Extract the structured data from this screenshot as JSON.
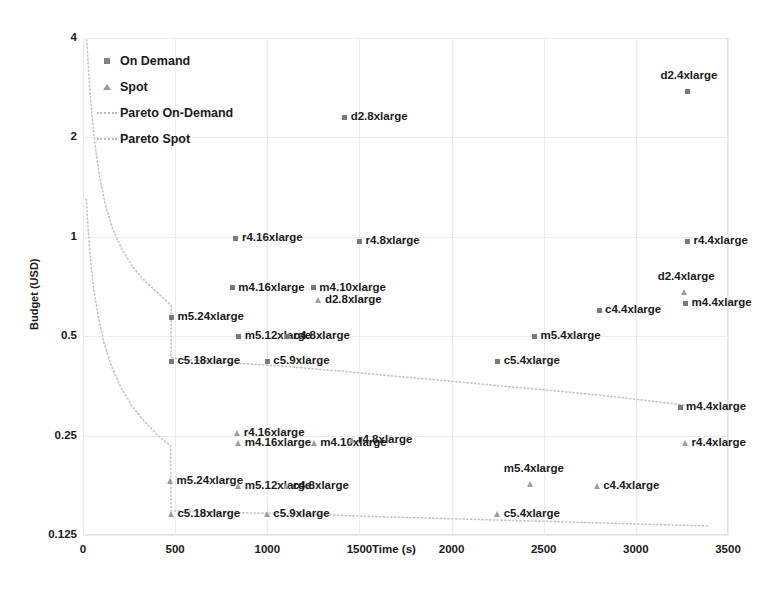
{
  "chart_data": {
    "type": "scatter",
    "title": "",
    "xlabel": "Time (s)",
    "ylabel": "Budget (USD)",
    "xlim": [
      0,
      3500
    ],
    "ylim": [
      0.125,
      4
    ],
    "yscale": "log2",
    "grid": true,
    "legend_position": "top-left",
    "xticks": [
      "0",
      "500",
      "1000",
      "1500",
      "2000",
      "2500",
      "3000",
      "3500"
    ],
    "xtick_values": [
      0,
      500,
      1000,
      1500,
      2000,
      2500,
      3000,
      3500
    ],
    "yticks": [
      "0.125",
      "0.25",
      "0.5",
      "1",
      "2",
      "4"
    ],
    "ytick_values": [
      0.125,
      0.25,
      0.5,
      1,
      2,
      4
    ],
    "legend": [
      {
        "label": "On Demand",
        "marker": "square",
        "color": "#808080"
      },
      {
        "label": "Spot",
        "marker": "triangle",
        "color": "#9a9a9a"
      },
      {
        "label": "Pareto On-Demand",
        "marker": "dotted-line",
        "color": "#bdbdbd"
      },
      {
        "label": "Pareto Spot",
        "marker": "dotted-line",
        "color": "#bdbdbd"
      }
    ],
    "series": [
      {
        "name": "On Demand",
        "marker": "square",
        "points": [
          {
            "label": "d2.4xlarge",
            "x": 3280,
            "y": 2.76,
            "pos": "above"
          },
          {
            "label": "d2.8xlarge",
            "x": 1420,
            "y": 2.3,
            "pos": "right"
          },
          {
            "label": "r4.16xlarge",
            "x": 830,
            "y": 0.99,
            "pos": "right"
          },
          {
            "label": "r4.8xlarge",
            "x": 1500,
            "y": 0.97,
            "pos": "right"
          },
          {
            "label": "r4.4xlarge",
            "x": 3280,
            "y": 0.97,
            "pos": "right"
          },
          {
            "label": "m4.16xlarge",
            "x": 810,
            "y": 0.7,
            "pos": "right"
          },
          {
            "label": "m4.10xlarge",
            "x": 1250,
            "y": 0.7,
            "pos": "right"
          },
          {
            "label": "m4.4xlarge",
            "x": 3270,
            "y": 0.63,
            "pos": "right"
          },
          {
            "label": "c4.4xlarge",
            "x": 2800,
            "y": 0.6,
            "pos": "right"
          },
          {
            "label": "m5.24xlarge",
            "x": 480,
            "y": 0.57,
            "pos": "right"
          },
          {
            "label": "m5.12xlarge",
            "x": 845,
            "y": 0.5,
            "pos": "right"
          },
          {
            "label": "c4.8xlarge",
            "x": 1110,
            "y": 0.5,
            "pos": "right"
          },
          {
            "label": "m5.4xlarge",
            "x": 2450,
            "y": 0.5,
            "pos": "right"
          },
          {
            "label": "c5.18xlarge",
            "x": 480,
            "y": 0.42,
            "pos": "right"
          },
          {
            "label": "c5.9xlarge",
            "x": 1000,
            "y": 0.42,
            "pos": "right"
          },
          {
            "label": "c5.4xlarge",
            "x": 2250,
            "y": 0.42,
            "pos": "right"
          },
          {
            "label": "m4.4xlarge",
            "x": 3240,
            "y": 0.305,
            "pos": "right"
          }
        ]
      },
      {
        "name": "Spot",
        "marker": "triangle",
        "points": [
          {
            "label": "d2.8xlarge",
            "x": 1280,
            "y": 0.645,
            "pos": "right"
          },
          {
            "label": "d2.4xlarge",
            "x": 3265,
            "y": 0.68,
            "pos": "above"
          },
          {
            "label": "r4.16xlarge",
            "x": 840,
            "y": 0.255,
            "pos": "right"
          },
          {
            "label": "m4.16xlarge",
            "x": 845,
            "y": 0.238,
            "pos": "right"
          },
          {
            "label": "m4.10xlarge",
            "x": 1255,
            "y": 0.238,
            "pos": "right"
          },
          {
            "label": "r4.8xlarge",
            "x": 1460,
            "y": 0.242,
            "pos": "right"
          },
          {
            "label": "r4.4xlarge",
            "x": 3270,
            "y": 0.238,
            "pos": "right"
          },
          {
            "label": "m5.24xlarge",
            "x": 475,
            "y": 0.182,
            "pos": "right"
          },
          {
            "label": "m5.12xlarge",
            "x": 845,
            "y": 0.176,
            "pos": "right"
          },
          {
            "label": "c4.8xlarge",
            "x": 1105,
            "y": 0.176,
            "pos": "right"
          },
          {
            "label": "m5.4xlarge",
            "x": 2430,
            "y": 0.178,
            "pos": "above"
          },
          {
            "label": "c4.4xlarge",
            "x": 2790,
            "y": 0.176,
            "pos": "right"
          },
          {
            "label": "c5.18xlarge",
            "x": 480,
            "y": 0.145,
            "pos": "right"
          },
          {
            "label": "c5.9xlarge",
            "x": 1000,
            "y": 0.145,
            "pos": "right"
          },
          {
            "label": "c5.4xlarge",
            "x": 2250,
            "y": 0.145,
            "pos": "right"
          }
        ]
      }
    ],
    "curves": [
      {
        "name": "Pareto On-Demand",
        "style": "dotted",
        "points": [
          [
            20,
            3.95
          ],
          [
            30,
            3.2
          ],
          [
            45,
            2.45
          ],
          [
            65,
            1.9
          ],
          [
            90,
            1.52
          ],
          [
            120,
            1.26
          ],
          [
            160,
            1.06
          ],
          [
            210,
            0.92
          ],
          [
            270,
            0.81
          ],
          [
            340,
            0.73
          ],
          [
            420,
            0.665
          ],
          [
            478,
            0.62
          ],
          [
            478,
            0.43
          ],
          [
            560,
            0.425
          ],
          [
            700,
            0.42
          ],
          [
            900,
            0.412
          ],
          [
            1100,
            0.405
          ],
          [
            1400,
            0.392
          ],
          [
            1700,
            0.378
          ],
          [
            2000,
            0.365
          ],
          [
            2300,
            0.352
          ],
          [
            2600,
            0.34
          ],
          [
            2900,
            0.327
          ],
          [
            3150,
            0.315
          ],
          [
            3300,
            0.308
          ]
        ]
      },
      {
        "name": "Pareto Spot",
        "style": "dotted",
        "points": [
          [
            18,
            1.3
          ],
          [
            28,
            1.05
          ],
          [
            42,
            0.84
          ],
          [
            60,
            0.68
          ],
          [
            85,
            0.565
          ],
          [
            115,
            0.475
          ],
          [
            155,
            0.405
          ],
          [
            205,
            0.35
          ],
          [
            265,
            0.308
          ],
          [
            335,
            0.275
          ],
          [
            415,
            0.248
          ],
          [
            475,
            0.233
          ],
          [
            478,
            0.148
          ],
          [
            600,
            0.147
          ],
          [
            800,
            0.146
          ],
          [
            1000,
            0.1455
          ],
          [
            1300,
            0.144
          ],
          [
            1600,
            0.142
          ],
          [
            1900,
            0.1405
          ],
          [
            2200,
            0.139
          ],
          [
            2500,
            0.1375
          ],
          [
            2800,
            0.136
          ],
          [
            3100,
            0.1345
          ],
          [
            3400,
            0.133
          ]
        ]
      }
    ]
  }
}
